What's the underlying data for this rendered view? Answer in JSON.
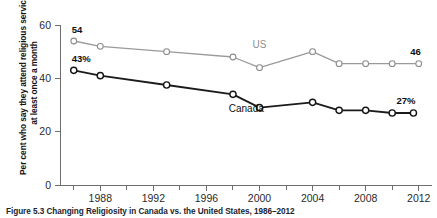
{
  "figure": {
    "caption": "Figure 5.3  Changing Religiosity in Canada vs. the United States, 1986–2012"
  },
  "chart_data": {
    "type": "line",
    "title": "",
    "xlabel": "",
    "ylabel": "Per cent who say they attend religious services at least once a month",
    "xlim": [
      1985,
      2013
    ],
    "ylim": [
      0,
      60
    ],
    "yticks": [
      "0",
      "20",
      "40",
      "60"
    ],
    "ytick_values": [
      0,
      20,
      40,
      60
    ],
    "xticks": [
      "1988",
      "1992",
      "1996",
      "2000",
      "2004",
      "2008",
      "2012"
    ],
    "xtick_values": [
      1988,
      1992,
      1996,
      2000,
      2004,
      2008,
      2012
    ],
    "xminor_values": [
      1986,
      1990,
      1994,
      1998,
      2002,
      2006,
      2010
    ],
    "grid": false,
    "legend_position": "inline",
    "series": [
      {
        "name": "US",
        "color": "#9a9a9a",
        "inline_label": "US",
        "inline_label_x": 2000,
        "inline_label_y": 51.5,
        "start_label": "54",
        "end_label": "46",
        "x": [
          1986,
          1988,
          1993,
          1998,
          2000,
          2004,
          2006,
          2008,
          2010,
          2012
        ],
        "values": [
          54,
          52,
          50,
          48,
          44,
          50,
          45.5,
          45.5,
          45.5,
          45.5
        ]
      },
      {
        "name": "Canada",
        "color": "#141414",
        "inline_label": "Canada",
        "inline_label_x": 1999,
        "inline_label_y": 27.5,
        "start_label": "43%",
        "end_label": "27%",
        "x": [
          1986,
          1988,
          1993,
          1998,
          2000,
          2004,
          2006,
          2008,
          2010,
          2011.6
        ],
        "values": [
          43,
          41,
          37.5,
          34,
          29,
          31,
          28,
          28,
          27,
          27
        ]
      }
    ],
    "annotations": [
      {
        "text": "54",
        "series": "US",
        "position": "start-above"
      },
      {
        "text": "46",
        "series": "US",
        "position": "end-above"
      },
      {
        "text": "43%",
        "series": "Canada",
        "position": "start-above"
      },
      {
        "text": "27%",
        "series": "Canada",
        "position": "end-above"
      }
    ]
  }
}
